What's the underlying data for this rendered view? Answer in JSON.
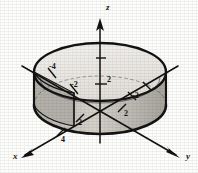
{
  "figure": {
    "kind": "3d-cylinder-plot",
    "background_color": "#fdfdfc",
    "ink_color": "#151515",
    "surface_fill": "#d9d6cf",
    "shadow_fill": "#8d8a84",
    "top_face_fill": "#efedea"
  },
  "axes": [
    {
      "id": "z",
      "label": "z",
      "direction": "up",
      "label_x": 106,
      "label_y": 3
    },
    {
      "id": "x",
      "label": "x",
      "direction": "lower-left",
      "label_x": 13,
      "label_y": 152
    },
    {
      "id": "y",
      "label": "y",
      "direction": "lower-right",
      "label_x": 186,
      "label_y": 152
    }
  ],
  "ticks": [
    {
      "axis": "z",
      "value": "2",
      "x": 107,
      "y": 76
    },
    {
      "axis": "y",
      "value": "-2",
      "x": 71,
      "y": 81
    },
    {
      "axis": "y",
      "value": "-4",
      "x": 49,
      "y": 63
    },
    {
      "axis": "x",
      "value": "-2",
      "x": 132,
      "y": 92
    },
    {
      "axis": "x",
      "value": "2",
      "x": 124,
      "y": 110
    },
    {
      "axis": "y",
      "value": "2",
      "x": 78,
      "y": 119
    },
    {
      "axis": "x",
      "value": "4",
      "x": 61,
      "y": 136
    }
  ]
}
